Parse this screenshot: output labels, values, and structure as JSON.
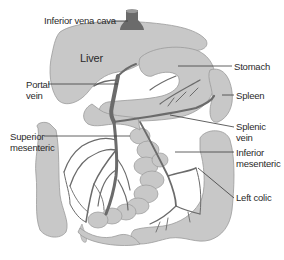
{
  "diagram": {
    "colors": {
      "organ_fill": "#c8c8c8",
      "organ_stroke": "#9a9a9a",
      "vessel": "#6b6b6b",
      "leader_line": "#3a3a3a",
      "text": "#2a2a2a",
      "background": "#ffffff"
    },
    "organ_labels": {
      "liver": "Liver"
    },
    "labels": {
      "inferior_vena_cava": "Inferior vena cava",
      "portal_vein_line1": "Portal",
      "portal_vein_line2": "vein",
      "stomach": "Stomach",
      "spleen": "Spleen",
      "splenic_vein_line1": "Splenic",
      "splenic_vein_line2": "vein",
      "superior_mesenteric_line1": "Superior",
      "superior_mesenteric_line2": "mesenteric",
      "inferior_mesenteric_line1": "Inferior",
      "inferior_mesenteric_line2": "mesenteric",
      "left_colic": "Left colic"
    }
  }
}
